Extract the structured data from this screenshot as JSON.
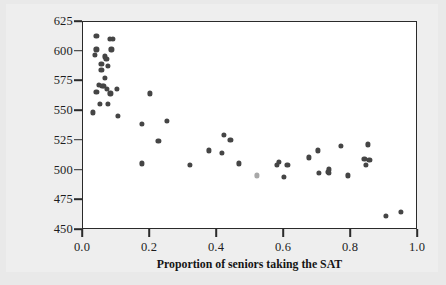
{
  "chart_data": {
    "type": "scatter",
    "title": "",
    "subtitle": "",
    "xlabel": "Proportion of seniors taking the SAT",
    "ylabel": "State average SAT Mathematics score",
    "ylabel_line1": "State average SAT Mathematics",
    "ylabel_line2": "score",
    "xlim": [
      0.0,
      1.0
    ],
    "ylim": [
      450,
      625
    ],
    "xticks": [
      "0.0",
      "0.2",
      "0.4",
      "0.6",
      "0.8",
      "1.0"
    ],
    "xtick_values": [
      0.0,
      0.2,
      0.4,
      0.6,
      0.8,
      1.0
    ],
    "yticks": [
      "450",
      "475",
      "500",
      "525",
      "550",
      "575",
      "600",
      "625"
    ],
    "ytick_values": [
      450,
      475,
      500,
      525,
      550,
      575,
      600,
      625
    ],
    "grid": false,
    "legend": null,
    "annotations": [],
    "marker_color": "#454545",
    "highlight_marker_color": "#a8a8a8",
    "frame_color": "#2a2a2a",
    "plot_background": "#ffffff",
    "page_background": "#eeeeee",
    "n_points": 55,
    "points": [
      {
        "x": 0.04,
        "y": 613
      },
      {
        "x": 0.09,
        "y": 611
      },
      {
        "x": 0.08,
        "y": 611
      },
      {
        "x": 0.04,
        "y": 602
      },
      {
        "x": 0.085,
        "y": 602
      },
      {
        "x": 0.035,
        "y": 597
      },
      {
        "x": 0.065,
        "y": 596
      },
      {
        "x": 0.07,
        "y": 594
      },
      {
        "x": 0.055,
        "y": 590
      },
      {
        "x": 0.075,
        "y": 588
      },
      {
        "x": 0.055,
        "y": 585
      },
      {
        "x": 0.065,
        "y": 578
      },
      {
        "x": 0.048,
        "y": 572
      },
      {
        "x": 0.058,
        "y": 571
      },
      {
        "x": 0.062,
        "y": 571
      },
      {
        "x": 0.072,
        "y": 569
      },
      {
        "x": 0.1,
        "y": 569
      },
      {
        "x": 0.04,
        "y": 566
      },
      {
        "x": 0.082,
        "y": 565
      },
      {
        "x": 0.2,
        "y": 565
      },
      {
        "x": 0.05,
        "y": 556
      },
      {
        "x": 0.075,
        "y": 556
      },
      {
        "x": 0.03,
        "y": 549
      },
      {
        "x": 0.105,
        "y": 546
      },
      {
        "x": 0.25,
        "y": 542
      },
      {
        "x": 0.175,
        "y": 539
      },
      {
        "x": 0.42,
        "y": 530
      },
      {
        "x": 0.44,
        "y": 526
      },
      {
        "x": 0.225,
        "y": 525
      },
      {
        "x": 0.85,
        "y": 522
      },
      {
        "x": 0.77,
        "y": 521
      },
      {
        "x": 0.375,
        "y": 517
      },
      {
        "x": 0.7,
        "y": 517
      },
      {
        "x": 0.415,
        "y": 515
      },
      {
        "x": 0.675,
        "y": 511
      },
      {
        "x": 0.84,
        "y": 510
      },
      {
        "x": 0.855,
        "y": 509
      },
      {
        "x": 0.585,
        "y": 507
      },
      {
        "x": 0.175,
        "y": 506
      },
      {
        "x": 0.465,
        "y": 506
      },
      {
        "x": 0.845,
        "y": 505
      },
      {
        "x": 0.32,
        "y": 505
      },
      {
        "x": 0.61,
        "y": 505
      },
      {
        "x": 0.58,
        "y": 505
      },
      {
        "x": 0.735,
        "y": 501
      },
      {
        "x": 0.73,
        "y": 499
      },
      {
        "x": 0.735,
        "y": 498
      },
      {
        "x": 0.705,
        "y": 498
      },
      {
        "x": 0.52,
        "y": 496,
        "highlight": true
      },
      {
        "x": 0.79,
        "y": 496
      },
      {
        "x": 0.6,
        "y": 495
      },
      {
        "x": 0.95,
        "y": 465
      },
      {
        "x": 0.905,
        "y": 462
      }
    ]
  }
}
